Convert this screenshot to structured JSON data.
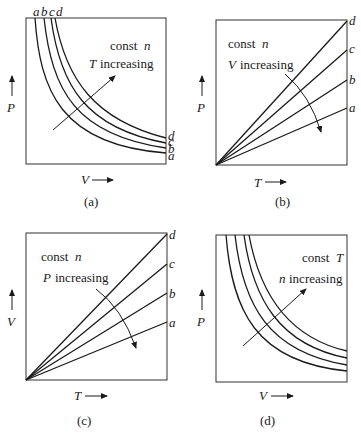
{
  "panels": [
    {
      "id": "a",
      "caption": "(a)",
      "constant": "const",
      "constant_var": "n",
      "trend_var": "T",
      "trend_text": "increasing",
      "x_axis": "V",
      "y_axis": "P",
      "curve_labels": [
        "a",
        "b",
        "c",
        "d"
      ]
    },
    {
      "id": "b",
      "caption": "(b)",
      "constant": "const",
      "constant_var": "n",
      "trend_var": "V",
      "trend_text": "increasing",
      "x_axis": "T",
      "y_axis": "P",
      "curve_labels": [
        "a",
        "b",
        "c",
        "d"
      ]
    },
    {
      "id": "c",
      "caption": "(c)",
      "constant": "const",
      "constant_var": "n",
      "trend_var": "P",
      "trend_text": "increasing",
      "x_axis": "T",
      "y_axis": "V",
      "curve_labels": [
        "a",
        "b",
        "c",
        "d"
      ]
    },
    {
      "id": "d",
      "caption": "(d)",
      "constant": "const",
      "constant_var": "T",
      "trend_var": "n",
      "trend_text": "increasing",
      "x_axis": "V",
      "y_axis": "P",
      "curve_labels": []
    }
  ]
}
